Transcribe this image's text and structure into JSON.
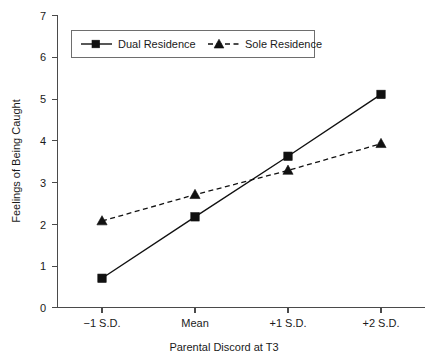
{
  "chart_data": {
    "type": "line",
    "title": "",
    "xlabel": "Parental Discord at T3",
    "ylabel": "Feelings of Being Caught",
    "categories": [
      "−1 S.D.",
      "Mean",
      "+1 S.D.",
      "+2 S.D."
    ],
    "ylim": [
      0,
      7
    ],
    "yticks": [
      "0",
      "1",
      "2",
      "3",
      "4",
      "5",
      "6",
      "7"
    ],
    "grid": false,
    "legend_position": "top-left",
    "series": [
      {
        "name": "Dual Residence",
        "values": [
          0.7,
          2.17,
          3.62,
          5.1
        ],
        "line_style": "solid",
        "marker": "square",
        "color": "#111111"
      },
      {
        "name": "Sole Residence",
        "values": [
          2.07,
          2.7,
          3.28,
          3.92
        ],
        "line_style": "dashed",
        "marker": "triangle",
        "color": "#111111"
      }
    ]
  },
  "axes": {
    "y_title": "Feelings of Being Caught",
    "x_title": "Parental Discord at T3"
  },
  "legend": {
    "entries": [
      {
        "label": "Dual Residence",
        "marker": "square-marker-icon",
        "style": "solid"
      },
      {
        "label": "Sole Residence",
        "marker": "triangle-marker-icon",
        "style": "dashed"
      }
    ]
  },
  "ticks": {
    "y": [
      "7",
      "6",
      "5",
      "4",
      "3",
      "2",
      "1",
      "0"
    ],
    "x": [
      "−1 S.D.",
      "Mean",
      "+1 S.D.",
      "+2 S.D."
    ]
  }
}
